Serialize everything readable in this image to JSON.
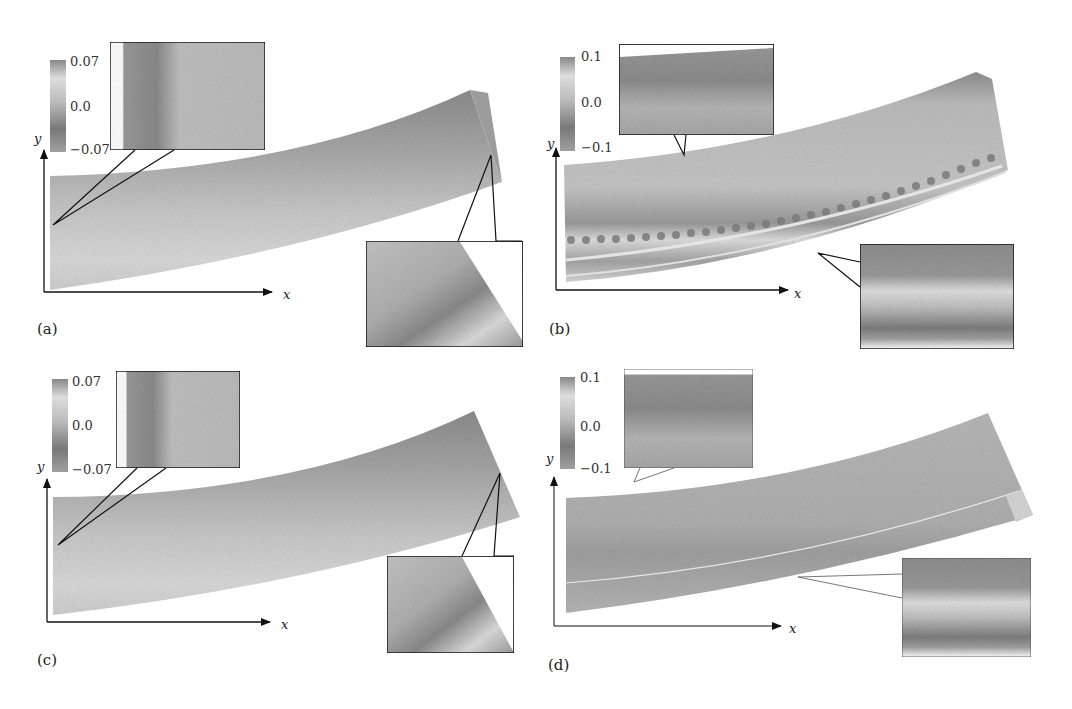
{
  "figure": {
    "panels": [
      {
        "id": "a",
        "label": "(a)",
        "colorbar": {
          "max": "0.07",
          "mid": "0.0",
          "min": "−0.07"
        },
        "axes": {
          "x": "x",
          "y": "y"
        },
        "beam_features": "smooth gradient, fold at right end",
        "insets": [
          "top-left edge detail",
          "right-end corner detail"
        ]
      },
      {
        "id": "b",
        "label": "(b)",
        "colorbar": {
          "max": "0.1",
          "mid": "0.0",
          "min": "−0.1"
        },
        "axes": {
          "x": "x",
          "y": "y"
        },
        "beam_features": "row of periodic dark dots along lower band",
        "insets": [
          "top edge detail",
          "lower band detail"
        ]
      },
      {
        "id": "c",
        "label": "(c)",
        "colorbar": {
          "max": "0.07",
          "mid": "0.0",
          "min": "−0.07"
        },
        "axes": {
          "x": "x",
          "y": "y"
        },
        "beam_features": "smooth gradient, fold at right end",
        "insets": [
          "top-left edge detail",
          "right-end corner detail"
        ]
      },
      {
        "id": "d",
        "label": "(d)",
        "colorbar": {
          "max": "0.1",
          "mid": "0.0",
          "min": "−0.1"
        },
        "axes": {
          "x": "x",
          "y": "y"
        },
        "beam_features": "thin light seam line along lower band",
        "insets": [
          "top edge detail",
          "lower band detail"
        ]
      }
    ],
    "colors": {
      "beam_dark": "#8a8a8a",
      "beam_mid": "#b4b4b4",
      "beam_light": "#dcdcdc",
      "frame": "#1a1a1a",
      "background": "#ffffff"
    }
  }
}
